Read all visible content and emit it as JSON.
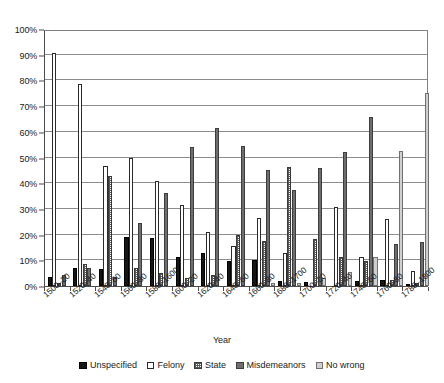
{
  "chart_data": {
    "type": "bar",
    "title": "",
    "xlabel": "Year",
    "ylabel": "",
    "ylim": [
      0,
      100
    ],
    "y_unit": "%",
    "grid": true,
    "legend_position": "bottom",
    "y_ticks": [
      "0%",
      "10%",
      "20%",
      "30%",
      "40%",
      "50%",
      "60%",
      "70%",
      "80%",
      "90%",
      "100%"
    ],
    "y_tick_values": [
      0,
      10,
      20,
      30,
      40,
      50,
      60,
      70,
      80,
      90,
      100
    ],
    "categories": [
      "1500–20",
      "1520–40",
      "1540–60",
      "1560–80",
      "1580–1600",
      "1600–20",
      "1620–40",
      "1640–60",
      "1660–80",
      "1680–1700",
      "1700–20",
      "1720–40",
      "1740–60",
      "1760–80",
      "1780–1800"
    ],
    "series": [
      {
        "name": "Unspecified",
        "color": "#161616",
        "pattern": "solid-black",
        "values": [
          3.7,
          7.0,
          6.6,
          19.0,
          18.6,
          11.1,
          12.8,
          9.9,
          10.0,
          2.0,
          1.5,
          0.0,
          1.8,
          2.2,
          0.4
        ]
      },
      {
        "name": "Felony",
        "color": "#ffffff",
        "pattern": "outline-white",
        "values": [
          90.8,
          78.7,
          46.6,
          49.7,
          40.8,
          31.5,
          20.9,
          15.5,
          26.6,
          13.0,
          0.0,
          30.9,
          11.4,
          26.2,
          6.0
        ]
      },
      {
        "name": "State",
        "color": "#5a5a5a",
        "pattern": "fine-dotted",
        "values": [
          1.2,
          8.5,
          43.0,
          7.2,
          4.9,
          3.2,
          4.4,
          19.8,
          17.6,
          46.2,
          18.4,
          11.4,
          9.7,
          2.2,
          1.0
        ]
      },
      {
        "name": "Misdemeanors",
        "color": "#6e6e6e",
        "pattern": "solid-gray",
        "values": [
          4.4,
          6.9,
          3.7,
          24.6,
          36.0,
          54.2,
          61.5,
          54.6,
          45.0,
          37.4,
          46.0,
          52.0,
          65.9,
          16.5,
          17.2
        ]
      },
      {
        "name": "No wrong",
        "color": "#cfcfcf",
        "pattern": "light-gray",
        "values": [
          0.0,
          0.0,
          0.0,
          0.0,
          0.0,
          0.0,
          0.0,
          0.0,
          1.0,
          1.2,
          3.0,
          5.4,
          11.3,
          52.7,
          75.1
        ]
      }
    ]
  }
}
